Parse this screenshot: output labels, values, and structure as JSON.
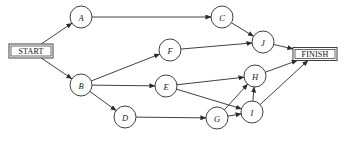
{
  "diagram": {
    "type": "directed-activity-network",
    "title": "",
    "canvas": {
      "width": 344,
      "height": 144,
      "background": "#ffffff"
    },
    "style": {
      "stroke": "#2b2b2b",
      "node_fill": "#ffffff",
      "node_radius": 11
    },
    "terminals": [
      {
        "id": "START",
        "label": "START",
        "x": 31,
        "y": 51,
        "w": 44,
        "h": 14
      },
      {
        "id": "FINISH",
        "label": "FINISH",
        "x": 315,
        "y": 54,
        "w": 44,
        "h": 13
      }
    ],
    "nodes": [
      {
        "id": "A",
        "label": "A",
        "cx": 81,
        "cy": 17,
        "r": 11
      },
      {
        "id": "B",
        "label": "B",
        "cx": 81,
        "cy": 85,
        "r": 11
      },
      {
        "id": "C",
        "label": "C",
        "cx": 222,
        "cy": 17,
        "r": 11
      },
      {
        "id": "D",
        "label": "D",
        "cx": 125,
        "cy": 117,
        "r": 11
      },
      {
        "id": "E",
        "label": "E",
        "cx": 166,
        "cy": 86,
        "r": 11
      },
      {
        "id": "F",
        "label": "F",
        "cx": 170,
        "cy": 50,
        "r": 11
      },
      {
        "id": "G",
        "label": "G",
        "cx": 217,
        "cy": 118,
        "r": 11
      },
      {
        "id": "H",
        "label": "H",
        "cx": 255,
        "cy": 76,
        "r": 11
      },
      {
        "id": "I",
        "label": "I",
        "cx": 252,
        "cy": 112,
        "r": 11
      },
      {
        "id": "J",
        "label": "J",
        "cx": 263,
        "cy": 42,
        "r": 11
      }
    ],
    "edges": [
      {
        "from": "START",
        "to": "A"
      },
      {
        "from": "START",
        "to": "B"
      },
      {
        "from": "A",
        "to": "C"
      },
      {
        "from": "B",
        "to": "F"
      },
      {
        "from": "B",
        "to": "E"
      },
      {
        "from": "B",
        "to": "D"
      },
      {
        "from": "C",
        "to": "J"
      },
      {
        "from": "F",
        "to": "J"
      },
      {
        "from": "D",
        "to": "G"
      },
      {
        "from": "E",
        "to": "H"
      },
      {
        "from": "E",
        "to": "I"
      },
      {
        "from": "G",
        "to": "H"
      },
      {
        "from": "G",
        "to": "I"
      },
      {
        "from": "I",
        "to": "H"
      },
      {
        "from": "J",
        "to": "FINISH"
      },
      {
        "from": "H",
        "to": "FINISH"
      },
      {
        "from": "I",
        "to": "FINISH"
      }
    ]
  }
}
